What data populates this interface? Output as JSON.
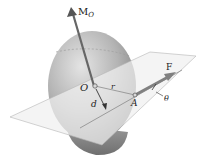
{
  "diagram": {
    "type": "mechanics-moment-of-force",
    "labels": {
      "moment": "M",
      "moment_subscript": "O",
      "origin": "O",
      "position_vector": "r",
      "distance": "d",
      "point": "A",
      "force": "F",
      "angle": "θ"
    },
    "colors": {
      "sphere_light": "#d9d9d9",
      "sphere_mid": "#a9a9a9",
      "sphere_dark": "#7a7a7a",
      "plane": "#e6e6e6",
      "arrow": "#6b6b6b",
      "text": "#222222"
    }
  }
}
